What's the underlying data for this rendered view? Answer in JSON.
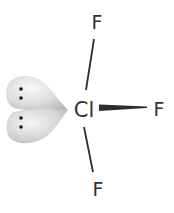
{
  "diagram": {
    "molecule": "ClF3",
    "geometry": "T-shaped",
    "central_atom": {
      "label": "Cl",
      "x": 84,
      "y": 117
    },
    "ligands": [
      {
        "label": "F",
        "position": "top",
        "x": 97,
        "y": 28
      },
      {
        "label": "F",
        "position": "right",
        "x": 159,
        "y": 116
      },
      {
        "label": "F",
        "position": "bottom",
        "x": 98,
        "y": 195
      }
    ],
    "bonds": [
      {
        "to": "top",
        "type": "line",
        "x1": 94,
        "y1": 39,
        "x2": 86,
        "y2": 90
      },
      {
        "to": "right",
        "type": "wedge",
        "x1": 99,
        "y1": 108,
        "x2": 147,
        "y2": 107
      },
      {
        "to": "bottom",
        "type": "line",
        "x1": 84,
        "y1": 127,
        "x2": 93,
        "y2": 172
      }
    ],
    "lone_pairs": [
      {
        "dots": [
          [
            21,
            89
          ],
          [
            21,
            98
          ]
        ]
      },
      {
        "dots": [
          [
            21,
            118
          ],
          [
            21,
            127
          ]
        ]
      }
    ],
    "colors": {
      "text": "#333333",
      "bond": "#2e2e2e",
      "lobe_light": "#f2f2f2",
      "lobe_dark": "#bdbdbd",
      "dot": "#1a1a1a"
    }
  }
}
